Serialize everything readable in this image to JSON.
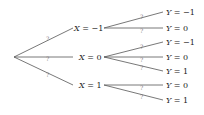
{
  "diagram": {
    "type": "probability-tree",
    "root": {
      "x": 14,
      "y": 57
    },
    "level1": [
      {
        "id": "x_m1",
        "var": "X",
        "value": "−1",
        "label": "X = −1",
        "prob": "?",
        "x": 74,
        "y": 28,
        "line_end_x": 73,
        "children": [
          {
            "id": "x_m1_y_m1",
            "var": "Y",
            "value": "−1",
            "label": "Y = −1",
            "prob": "?",
            "x": 166,
            "y": 12
          },
          {
            "id": "x_m1_y_0",
            "var": "Y",
            "value": "0",
            "label": "Y = 0",
            "prob": "?",
            "x": 166,
            "y": 28
          }
        ]
      },
      {
        "id": "x_0",
        "var": "X",
        "value": "0",
        "label": "X = 0",
        "prob": "?",
        "x": 79,
        "y": 57,
        "line_end_x": 73,
        "children": [
          {
            "id": "x_0_y_m1",
            "var": "Y",
            "value": "−1",
            "label": "Y = −1",
            "prob": "?",
            "x": 166,
            "y": 42
          },
          {
            "id": "x_0_y_0",
            "var": "Y",
            "value": "0",
            "label": "Y = 0",
            "prob": "?",
            "x": 166,
            "y": 57
          },
          {
            "id": "x_0_y_1",
            "var": "Y",
            "value": "1",
            "label": "Y = 1",
            "prob": "?",
            "x": 166,
            "y": 71
          }
        ]
      },
      {
        "id": "x_1",
        "var": "X",
        "value": "1",
        "label": "X = 1",
        "prob": "?",
        "x": 79,
        "y": 85,
        "line_end_x": 73,
        "children": [
          {
            "id": "x_1_y_0",
            "var": "Y",
            "value": "0",
            "label": "Y = 0",
            "prob": "?",
            "x": 166,
            "y": 85
          },
          {
            "id": "x_1_y_1",
            "var": "Y",
            "value": "1",
            "label": "Y = 1",
            "prob": "?",
            "x": 166,
            "y": 100
          }
        ]
      }
    ]
  }
}
